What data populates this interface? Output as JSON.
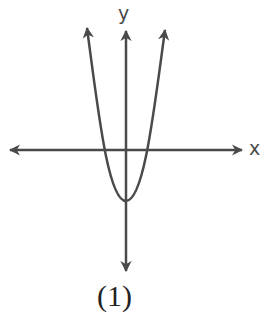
{
  "figure": {
    "x_axis_label": "x",
    "y_axis_label": "y",
    "caption": "(1)",
    "curve": "upward-opening parabola with vertex below the origin on the y-axis, crossing the x-axis at two points symmetric about the y-axis",
    "colors": {
      "stroke": "#4a4a4a",
      "background": "#ffffff"
    }
  }
}
